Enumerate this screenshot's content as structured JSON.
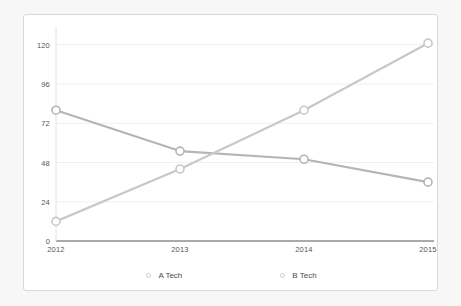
{
  "chart_data": {
    "type": "line",
    "title": "",
    "xlabel": "",
    "ylabel": "",
    "categories": [
      "2012",
      "2013",
      "2014",
      "2015"
    ],
    "x": [
      2012,
      2013,
      2014,
      2015
    ],
    "ylim": [
      0,
      126
    ],
    "xlim": [
      2012,
      2015
    ],
    "yticks": [
      0,
      24,
      48,
      72,
      96,
      120
    ],
    "ytick_labels": [
      "0",
      "24",
      "48",
      "72",
      "96",
      "120"
    ],
    "xtick_labels": [
      "2012",
      "2013",
      "2014",
      "2015"
    ],
    "grid": true,
    "grid_axis": "y",
    "legend_position": "bottom-center",
    "marker": "open-circle",
    "series": [
      {
        "name": "A Tech",
        "color": "#b5b5b5",
        "values": [
          80,
          55,
          50,
          36
        ]
      },
      {
        "name": "B Tech",
        "color": "#c8c8c8",
        "values": [
          12,
          44,
          80,
          121
        ]
      }
    ]
  },
  "legend": {
    "items": [
      {
        "label": "A Tech",
        "marker": "open-circle-marker"
      },
      {
        "label": "B Tech",
        "marker": "open-circle-marker"
      }
    ]
  },
  "colors": {
    "page_background": "#f7f7f7",
    "panel_background": "#ffffff",
    "panel_border": "#d8d8d8",
    "gridline": "#f0f0f0",
    "axis_line": "#555555",
    "tick_text": "#555555",
    "series_a": "#b5b5b5",
    "series_b": "#c8c8c8"
  }
}
